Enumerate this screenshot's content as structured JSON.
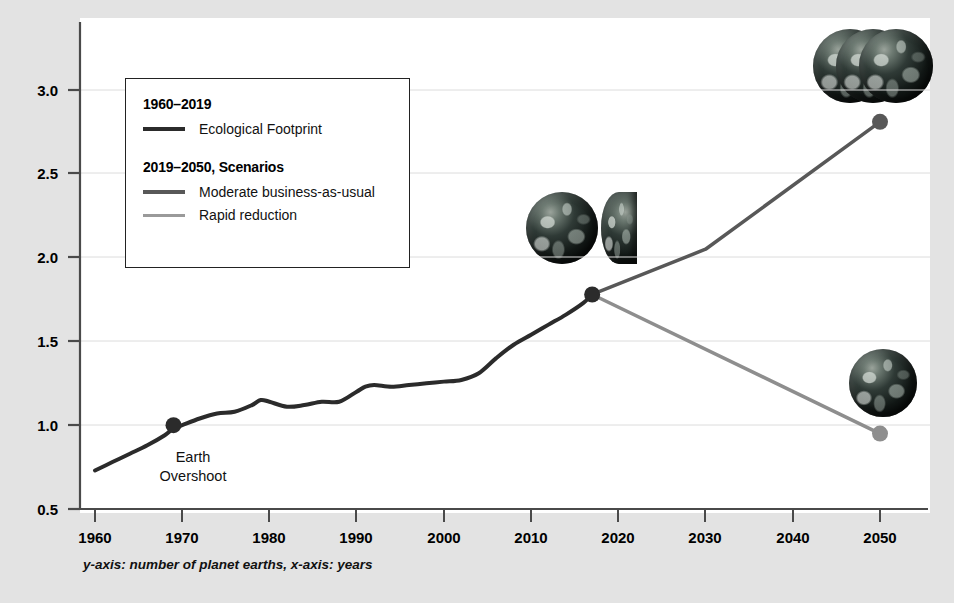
{
  "chart_data": {
    "type": "line",
    "title": "",
    "subtitle": "",
    "xlabel": "",
    "ylabel": "",
    "caption": "y-axis: number of planet earths, x-axis: years",
    "xlim": [
      1960,
      2055
    ],
    "ylim": [
      0.5,
      3.3
    ],
    "xticks": [
      1960,
      1970,
      1980,
      1990,
      2000,
      2010,
      2020,
      2030,
      2040,
      2050
    ],
    "yticks": [
      0.5,
      1.0,
      1.5,
      2.0,
      2.5,
      3.0
    ],
    "ytick_labels": [
      "0.5",
      "1.0",
      "1.5",
      "2.0",
      "2.5",
      "3.0"
    ],
    "xtick_labels": [
      "1960",
      "1970",
      "1980",
      "1990",
      "2000",
      "2010",
      "2020",
      "2030",
      "2040",
      "2050"
    ],
    "grid": true,
    "grid_axis": "y",
    "legend_position": "upper-left",
    "series": [
      {
        "name": "Ecological Footprint",
        "period": "1960-2019",
        "color": "#2b2b2b",
        "width": 4,
        "x": [
          1960,
          1962,
          1964,
          1966,
          1968,
          1969,
          1970,
          1972,
          1974,
          1976,
          1978,
          1979,
          1980,
          1982,
          1984,
          1986,
          1988,
          1990,
          1991,
          1992,
          1994,
          1996,
          1998,
          2000,
          2002,
          2004,
          2006,
          2008,
          2010,
          2012,
          2014,
          2016,
          2017
        ],
        "y": [
          0.73,
          0.78,
          0.83,
          0.88,
          0.94,
          0.98,
          1.0,
          1.04,
          1.07,
          1.08,
          1.12,
          1.15,
          1.14,
          1.11,
          1.12,
          1.14,
          1.14,
          1.2,
          1.23,
          1.24,
          1.23,
          1.24,
          1.25,
          1.26,
          1.27,
          1.31,
          1.4,
          1.48,
          1.54,
          1.6,
          1.66,
          1.73,
          1.78
        ]
      },
      {
        "name": "Moderate business-as-usual",
        "period": "2019-2050",
        "color": "#585858",
        "width": 3.5,
        "x": [
          2017,
          2030,
          2050
        ],
        "y": [
          1.78,
          2.05,
          2.81
        ]
      },
      {
        "name": "Rapid reduction",
        "period": "2019-2050",
        "color": "#8e8e8e",
        "width": 3.5,
        "x": [
          2017,
          2050
        ],
        "y": [
          1.78,
          0.95
        ]
      }
    ],
    "markers": [
      {
        "name": "earth-overshoot-marker",
        "x": 1969,
        "y": 1.0,
        "label": "Earth\nOvershoot",
        "color": "#2b2b2b"
      },
      {
        "name": "branch-point-marker",
        "x": 2017,
        "y": 1.78,
        "label": "",
        "color": "#2b2b2b"
      },
      {
        "name": "business-as-usual-endpoint-marker",
        "x": 2050,
        "y": 2.81,
        "label": "",
        "color": "#585858"
      },
      {
        "name": "rapid-reduction-endpoint-marker",
        "x": 2050,
        "y": 0.95,
        "label": "",
        "color": "#8e8e8e"
      }
    ],
    "annotations": [
      {
        "name": "earth-overshoot-label",
        "line1": "Earth",
        "line2": "Overshoot",
        "x": 1969,
        "y": 0.82
      }
    ],
    "earth_icons": [
      {
        "name": "earth-icon-present",
        "count": 1.5,
        "x": 2017,
        "y": 2.22,
        "note": "one and a half earths at 2019"
      },
      {
        "name": "earth-icon-business-as-usual",
        "count": 2.8,
        "x": 2049,
        "y": 3.1,
        "note": "nearly three earths in 2050"
      },
      {
        "name": "earth-icon-rapid-reduction",
        "count": 1,
        "x": 2050,
        "y": 1.3,
        "note": "one earth in 2050"
      }
    ]
  },
  "legend": {
    "group1": {
      "heading": "1960–2019",
      "items": [
        {
          "label": "Ecological Footprint",
          "color": "#2b2b2b"
        }
      ]
    },
    "group2": {
      "heading": "2019–2050, Scenarios",
      "items": [
        {
          "label": "Moderate business-as-usual",
          "color": "#585858"
        },
        {
          "label": "Rapid reduction",
          "color": "#8e8e8e"
        }
      ]
    }
  },
  "annotation": {
    "line1": "Earth",
    "line2": "Overshoot"
  },
  "caption": {
    "text": "y-axis: number of planet earths, x-axis: years"
  },
  "colors": {
    "page_background": "#e3e3e3",
    "plot_background": "#ffffff",
    "axis": "#4a4a4a",
    "grid": "#d8d8d8",
    "historic_line": "#2b2b2b",
    "bau_line": "#585858",
    "rapid_line": "#8e8e8e"
  }
}
